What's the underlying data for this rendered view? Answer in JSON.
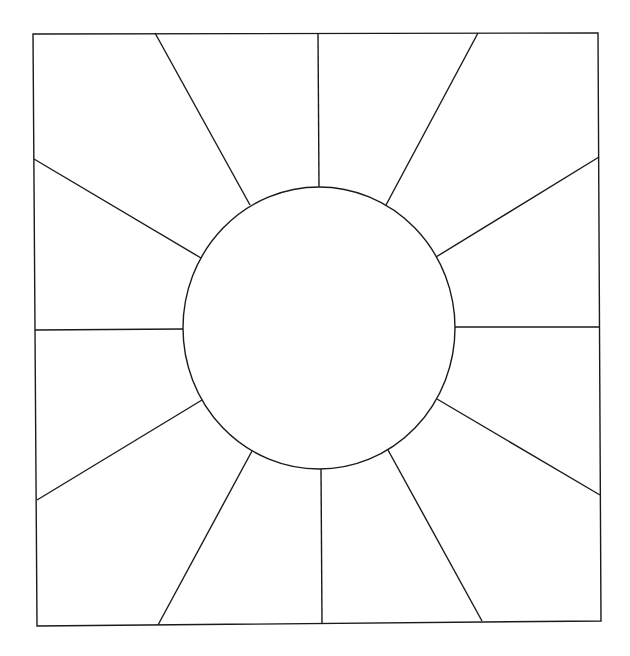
{
  "diagram": {
    "stroke_color": "#1a1a1a",
    "background_color": "#ffffff",
    "frame": {
      "points": [
        [
          33,
          34
        ],
        [
          598,
          33
        ],
        [
          601,
          621
        ],
        [
          37,
          626
        ]
      ]
    },
    "circle": {
      "cx": 319,
      "cy": 328,
      "rx": 136,
      "ry": 141
    },
    "rays": [
      {
        "id": "ray-n",
        "x1": 319,
        "y1": 187,
        "x2": 318,
        "y2": 33
      },
      {
        "id": "ray-nne",
        "x1": 386,
        "y1": 205,
        "x2": 478,
        "y2": 33
      },
      {
        "id": "ray-ene",
        "x1": 436,
        "y1": 257,
        "x2": 599,
        "y2": 157
      },
      {
        "id": "ray-e",
        "x1": 454,
        "y1": 327,
        "x2": 600,
        "y2": 327
      },
      {
        "id": "ray-ese",
        "x1": 437,
        "y1": 399,
        "x2": 600,
        "y2": 495
      },
      {
        "id": "ray-sse",
        "x1": 388,
        "y1": 450,
        "x2": 482,
        "y2": 621
      },
      {
        "id": "ray-s",
        "x1": 321,
        "y1": 469,
        "x2": 322,
        "y2": 623
      },
      {
        "id": "ray-ssw",
        "x1": 252,
        "y1": 451,
        "x2": 158,
        "y2": 625
      },
      {
        "id": "ray-wsw",
        "x1": 202,
        "y1": 400,
        "x2": 37,
        "y2": 500
      },
      {
        "id": "ray-w",
        "x1": 183,
        "y1": 329,
        "x2": 35,
        "y2": 330
      },
      {
        "id": "ray-wnw",
        "x1": 201,
        "y1": 258,
        "x2": 34,
        "y2": 159
      },
      {
        "id": "ray-nnw",
        "x1": 250,
        "y1": 205,
        "x2": 155,
        "y2": 33
      }
    ]
  }
}
